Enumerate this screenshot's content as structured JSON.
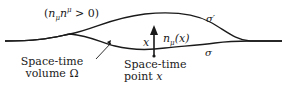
{
  "diagram": {
    "condition_label": "(nμnμ > 0)",
    "condition_parts": {
      "open": "(",
      "n1": "n",
      "sub": "μ",
      "n2": "n",
      "sup": "μ",
      "rest": " > 0)"
    },
    "surface_upper_label": "σ′",
    "surface_lower_label": "σ",
    "point_label": "x",
    "normal_label": {
      "n": "n",
      "sub": "μ",
      "arg": "(x)"
    },
    "volume_label": {
      "line1": "Space-time",
      "line2": "volume Ω"
    },
    "point_caption": {
      "line1": "Space-time",
      "line2_text": "point ",
      "line2_var": "x"
    },
    "colors": {
      "stroke": "#1a1a1a",
      "background": "#ffffff"
    }
  }
}
